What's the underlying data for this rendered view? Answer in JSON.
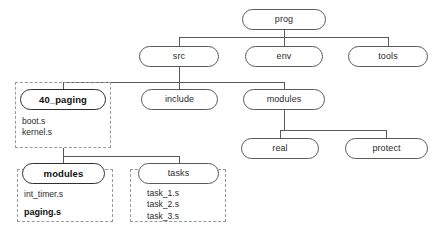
{
  "diagram": {
    "type": "directory-tree",
    "background_color": "#ffffff",
    "line_color": "#5a5a5a",
    "dashed_border_color": "#9a9a9a",
    "nodes": [
      {
        "id": "prog",
        "label": "prog",
        "bold": false,
        "x": 242,
        "y": 9,
        "w": 84,
        "h": 21
      },
      {
        "id": "src",
        "label": "src",
        "bold": false,
        "x": 139,
        "y": 46,
        "w": 80,
        "h": 21
      },
      {
        "id": "env",
        "label": "env",
        "bold": false,
        "x": 245,
        "y": 46,
        "w": 78,
        "h": 21
      },
      {
        "id": "tools",
        "label": "tools",
        "bold": false,
        "x": 348,
        "y": 46,
        "w": 80,
        "h": 21
      },
      {
        "id": "40_paging",
        "label": "40_paging",
        "bold": true,
        "x": 20,
        "y": 89,
        "w": 86,
        "h": 21
      },
      {
        "id": "include",
        "label": "include",
        "bold": false,
        "x": 141,
        "y": 89,
        "w": 77,
        "h": 21
      },
      {
        "id": "env_modules",
        "label": "modules",
        "bold": false,
        "x": 243,
        "y": 89,
        "w": 82,
        "h": 21
      },
      {
        "id": "real",
        "label": "real",
        "bold": false,
        "x": 241,
        "y": 138,
        "w": 78,
        "h": 21
      },
      {
        "id": "protect",
        "label": "protect",
        "bold": false,
        "x": 345,
        "y": 138,
        "w": 83,
        "h": 21
      },
      {
        "id": "sub_modules",
        "label": "modules",
        "bold": true,
        "x": 22,
        "y": 163,
        "w": 83,
        "h": 21
      },
      {
        "id": "tasks",
        "label": "tasks",
        "bold": false,
        "x": 138,
        "y": 163,
        "w": 81,
        "h": 21
      }
    ],
    "groups": [
      {
        "id": "group-40-paging",
        "x": 15,
        "y": 82,
        "w": 96,
        "h": 66,
        "files": [
          {
            "name": "boot.s",
            "bold": false
          },
          {
            "name": "kernel.s",
            "bold": false
          }
        ],
        "files_x": 22,
        "files_y": 116
      },
      {
        "id": "group-sub-modules",
        "x": 17,
        "y": 169,
        "w": 96,
        "h": 53,
        "files": [
          {
            "name": "int_timer.s",
            "bold": false
          },
          {
            "name": "",
            "bold": false
          },
          {
            "name": "paging.s",
            "bold": true
          }
        ],
        "files_x": 24,
        "files_y": 189
      },
      {
        "id": "group-tasks",
        "x": 130,
        "y": 169,
        "w": 96,
        "h": 53,
        "files": [
          {
            "name": "task_1.s",
            "bold": false
          },
          {
            "name": "task_2.s",
            "bold": false
          },
          {
            "name": "task_3.s",
            "bold": false
          }
        ],
        "files_x": 147,
        "files_y": 188
      }
    ],
    "edges": [
      {
        "from": "prog",
        "to": "src",
        "desc": "prog-to-src"
      },
      {
        "from": "prog",
        "to": "env",
        "desc": "prog-to-env"
      },
      {
        "from": "prog",
        "to": "tools",
        "desc": "prog-to-tools"
      },
      {
        "from": "src",
        "to": "40_paging",
        "desc": "src-to-40-paging"
      },
      {
        "from": "src",
        "to": "include",
        "desc": "src-to-include"
      },
      {
        "from": "src",
        "to": "env_modules",
        "desc": "src-to-modules"
      },
      {
        "from": "env_modules",
        "to": "real",
        "desc": "modules-to-real"
      },
      {
        "from": "env_modules",
        "to": "protect",
        "desc": "modules-to-protect"
      },
      {
        "from": "40_paging",
        "to": "sub_modules",
        "desc": "paging-to-modules"
      },
      {
        "from": "40_paging",
        "to": "tasks",
        "desc": "paging-to-tasks"
      }
    ],
    "artifact_text": ""
  }
}
